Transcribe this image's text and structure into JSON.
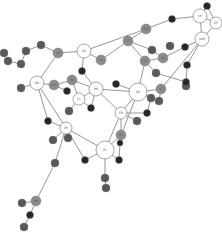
{
  "diagram": {
    "type": "network-graph",
    "colors": {
      "white": "#ffffff",
      "gray": "#8c8c8c",
      "darkgray": "#5a5a5a",
      "black": "#262626",
      "stroke": "#6a6a6a",
      "edge": "#6a6a6a"
    },
    "nodes": [
      {
        "id": "SP",
        "label": "SP",
        "x": 84,
        "y": 51,
        "r": 7,
        "fill": "white"
      },
      {
        "id": "BR",
        "label": "BR",
        "x": 37,
        "y": 83,
        "r": 7,
        "fill": "white"
      },
      {
        "id": "RB",
        "label": "RB",
        "x": 96,
        "y": 89,
        "r": 7,
        "fill": "white"
      },
      {
        "id": "CL",
        "label": "CL",
        "x": 79,
        "y": 99,
        "r": 6,
        "fill": "white"
      },
      {
        "id": "DE",
        "label": "DE",
        "x": 138,
        "y": 92,
        "r": 9,
        "fill": "white"
      },
      {
        "id": "FR",
        "label": "FR",
        "x": 121,
        "y": 113,
        "r": 6,
        "fill": "white"
      },
      {
        "id": "PL",
        "label": "PL",
        "x": 105,
        "y": 150,
        "r": 9,
        "fill": "white"
      },
      {
        "id": "BY",
        "label": "BY",
        "x": 66,
        "y": 128,
        "r": 6,
        "fill": "white"
      },
      {
        "id": "VP",
        "label": "VP",
        "x": 200,
        "y": 16,
        "r": 7,
        "fill": "white"
      },
      {
        "id": "GF",
        "label": "GF",
        "x": 216,
        "y": 23,
        "r": 6,
        "fill": "white"
      },
      {
        "id": "UKR",
        "label": "UKR",
        "x": 202,
        "y": 39,
        "r": 7,
        "fill": "white"
      },
      {
        "id": "LB",
        "label": "LB",
        "x": 58,
        "y": 53,
        "r": 5,
        "fill": "gray"
      },
      {
        "id": "MD",
        "label": "MD",
        "x": 54,
        "y": 85,
        "r": 5,
        "fill": "gray"
      },
      {
        "id": "RO",
        "label": "RO",
        "x": 72,
        "y": 80,
        "r": 5,
        "fill": "gray"
      },
      {
        "id": "LV",
        "label": "LV",
        "x": 101,
        "y": 60,
        "r": 5,
        "fill": "gray"
      },
      {
        "id": "EST",
        "label": "EST",
        "x": 146,
        "y": 29,
        "r": 5,
        "fill": "gray"
      },
      {
        "id": "LT",
        "label": "LT",
        "x": 128,
        "y": 41,
        "r": 5,
        "fill": "gray"
      },
      {
        "id": "CZ",
        "label": "CZ",
        "x": 145,
        "y": 61,
        "r": 5,
        "fill": "gray"
      },
      {
        "id": "SK",
        "label": "SK",
        "x": 163,
        "y": 58,
        "r": 5,
        "fill": "gray"
      },
      {
        "id": "AT",
        "label": "AT",
        "x": 161,
        "y": 89,
        "r": 5,
        "fill": "gray"
      },
      {
        "id": "HU",
        "label": "HU",
        "x": 121,
        "y": 135,
        "r": 5,
        "fill": "gray"
      },
      {
        "id": "GR",
        "label": "GR",
        "x": 36,
        "y": 201,
        "r": 5,
        "fill": "gray"
      },
      {
        "id": "d1",
        "label": "SI",
        "x": 41,
        "y": 45,
        "r": 4,
        "fill": "darkgray"
      },
      {
        "id": "d2",
        "label": "HR",
        "x": 26,
        "y": 51,
        "r": 4,
        "fill": "darkgray"
      },
      {
        "id": "d3",
        "label": "BA",
        "x": 21,
        "y": 64,
        "r": 4,
        "fill": "darkgray"
      },
      {
        "id": "d4",
        "label": "RS",
        "x": 8,
        "y": 61,
        "r": 4,
        "fill": "darkgray"
      },
      {
        "id": "d5",
        "label": "ME",
        "x": 21,
        "y": 88,
        "r": 4,
        "fill": "darkgray"
      },
      {
        "id": "d6",
        "label": "AL",
        "x": 69,
        "y": 111,
        "r": 4,
        "fill": "darkgray"
      },
      {
        "id": "d7",
        "label": "MK",
        "x": 152,
        "y": 50,
        "r": 4,
        "fill": "darkgray"
      },
      {
        "id": "d8",
        "label": "BG",
        "x": 170,
        "y": 46,
        "r": 4,
        "fill": "darkgray"
      },
      {
        "id": "d9",
        "label": "TR",
        "x": 4,
        "y": 53,
        "r": 4,
        "fill": "darkgray"
      },
      {
        "id": "d10",
        "label": "CY",
        "x": 156,
        "y": 73,
        "r": 4,
        "fill": "darkgray"
      },
      {
        "id": "d11",
        "label": "MT",
        "x": 186,
        "y": 86,
        "r": 4,
        "fill": "darkgray"
      },
      {
        "id": "d12",
        "label": "IS",
        "x": 159,
        "y": 101,
        "r": 4,
        "fill": "darkgray"
      },
      {
        "id": "d13",
        "label": "IE",
        "x": 137,
        "y": 121,
        "r": 4,
        "fill": "darkgray"
      },
      {
        "id": "d14",
        "label": "LU",
        "x": 151,
        "y": 98,
        "r": 4,
        "fill": "darkgray"
      },
      {
        "id": "d15",
        "label": "NL",
        "x": 105,
        "y": 178,
        "r": 4,
        "fill": "darkgray"
      },
      {
        "id": "d16",
        "label": "BE",
        "x": 106,
        "y": 188,
        "r": 4,
        "fill": "darkgray"
      },
      {
        "id": "d17",
        "label": "DK",
        "x": 55,
        "y": 163,
        "r": 4,
        "fill": "darkgray"
      },
      {
        "id": "d18",
        "label": "NO",
        "x": 22,
        "y": 203,
        "r": 4,
        "fill": "darkgray"
      },
      {
        "id": "d19",
        "label": "SE",
        "x": 24,
        "y": 227,
        "r": 4,
        "fill": "darkgray"
      },
      {
        "id": "d20",
        "label": "FI",
        "x": 53,
        "y": 140,
        "r": 4,
        "fill": "darkgray"
      },
      {
        "id": "d21",
        "label": "PT",
        "x": 68,
        "y": 138,
        "r": 4,
        "fill": "darkgray"
      },
      {
        "id": "b1",
        "label": "",
        "x": 82,
        "y": 71,
        "r": 3.5,
        "fill": "black"
      },
      {
        "id": "b2",
        "label": "",
        "x": 67,
        "y": 91,
        "r": 3.5,
        "fill": "black"
      },
      {
        "id": "b3",
        "label": "",
        "x": 91,
        "y": 108,
        "r": 3.5,
        "fill": "black"
      },
      {
        "id": "b4",
        "label": "",
        "x": 172,
        "y": 19,
        "r": 3.5,
        "fill": "black"
      },
      {
        "id": "b5",
        "label": "",
        "x": 185,
        "y": 47,
        "r": 3.5,
        "fill": "black"
      },
      {
        "id": "b6",
        "label": "",
        "x": 187,
        "y": 65,
        "r": 3.5,
        "fill": "black"
      },
      {
        "id": "b7",
        "label": "",
        "x": 186,
        "y": 82,
        "r": 3.5,
        "fill": "black"
      },
      {
        "id": "b8",
        "label": "",
        "x": 116,
        "y": 84,
        "r": 3.5,
        "fill": "black"
      },
      {
        "id": "b9",
        "label": "",
        "x": 147,
        "y": 113,
        "r": 3.5,
        "fill": "black"
      },
      {
        "id": "b10",
        "label": "",
        "x": 48,
        "y": 121,
        "r": 3.5,
        "fill": "black"
      },
      {
        "id": "b11",
        "label": "",
        "x": 85,
        "y": 160,
        "r": 3.5,
        "fill": "black"
      },
      {
        "id": "b12",
        "label": "",
        "x": 30,
        "y": 215,
        "r": 3.5,
        "fill": "black"
      },
      {
        "id": "b13",
        "label": "",
        "x": 119,
        "y": 160,
        "r": 3.5,
        "fill": "black"
      },
      {
        "id": "b14",
        "label": "",
        "x": 207,
        "y": 6,
        "r": 3.5,
        "fill": "black"
      },
      {
        "id": "b15",
        "label": "",
        "x": 120,
        "y": 143,
        "r": 3,
        "fill": "black"
      }
    ],
    "edges": [
      [
        "SP",
        "LB"
      ],
      [
        "SP",
        "LV"
      ],
      [
        "SP",
        "b1"
      ],
      [
        "SP",
        "EST"
      ],
      [
        "LB",
        "d1"
      ],
      [
        "d1",
        "d2"
      ],
      [
        "d2",
        "d3"
      ],
      [
        "d3",
        "d4"
      ],
      [
        "LB",
        "BR"
      ],
      [
        "BR",
        "MD"
      ],
      [
        "BR",
        "d5"
      ],
      [
        "BR",
        "BY"
      ],
      [
        "MD",
        "RO"
      ],
      [
        "MD",
        "b2"
      ],
      [
        "b1",
        "RB"
      ],
      [
        "RO",
        "RB"
      ],
      [
        "RB",
        "CL"
      ],
      [
        "RB",
        "b3"
      ],
      [
        "CL",
        "b3"
      ],
      [
        "CL",
        "d6"
      ],
      [
        "RB",
        "DE"
      ],
      [
        "RB",
        "FR"
      ],
      [
        "RO",
        "CL"
      ],
      [
        "LV",
        "LT"
      ],
      [
        "LT",
        "EST"
      ],
      [
        "LT",
        "d7"
      ],
      [
        "LT",
        "CZ"
      ],
      [
        "EST",
        "b4"
      ],
      [
        "b4",
        "VP"
      ],
      [
        "CZ",
        "SK"
      ],
      [
        "CZ",
        "DE"
      ],
      [
        "CZ",
        "d10"
      ],
      [
        "SK",
        "b5"
      ],
      [
        "b5",
        "UKR"
      ],
      [
        "d7",
        "SK"
      ],
      [
        "VP",
        "GF"
      ],
      [
        "VP",
        "UKR"
      ],
      [
        "GF",
        "UKR"
      ],
      [
        "VP",
        "b14"
      ],
      [
        "b14",
        "GF"
      ],
      [
        "UKR",
        "b6"
      ],
      [
        "UKR",
        "AT"
      ],
      [
        "b6",
        "d11"
      ],
      [
        "d10",
        "b7"
      ],
      [
        "b7",
        "d11"
      ],
      [
        "DE",
        "b8"
      ],
      [
        "DE",
        "AT"
      ],
      [
        "DE",
        "FR"
      ],
      [
        "DE",
        "d12"
      ],
      [
        "DE",
        "d14"
      ],
      [
        "DE",
        "HU"
      ],
      [
        "AT",
        "d12"
      ],
      [
        "FR",
        "d13"
      ],
      [
        "FR",
        "HU"
      ],
      [
        "FR",
        "b9"
      ],
      [
        "d14",
        "b9"
      ],
      [
        "HU",
        "PL"
      ],
      [
        "HU",
        "b15"
      ],
      [
        "FR",
        "PL"
      ],
      [
        "PL",
        "b13"
      ],
      [
        "PL",
        "b11"
      ],
      [
        "PL",
        "BY"
      ],
      [
        "PL",
        "d15"
      ],
      [
        "d15",
        "d16"
      ],
      [
        "b15",
        "b13"
      ],
      [
        "BY",
        "b10"
      ],
      [
        "BY",
        "d20"
      ],
      [
        "BY",
        "b11"
      ],
      [
        "BY",
        "d17"
      ],
      [
        "d17",
        "GR"
      ],
      [
        "GR",
        "d18"
      ],
      [
        "GR",
        "b12"
      ],
      [
        "b12",
        "d19"
      ],
      [
        "b10",
        "BR"
      ]
    ]
  }
}
